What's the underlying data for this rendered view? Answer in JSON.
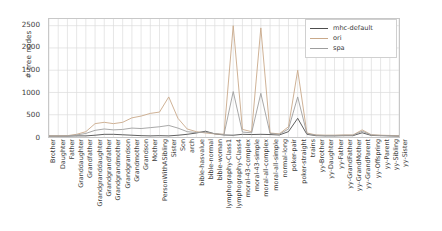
{
  "chart_data": {
    "type": "line",
    "title": "",
    "xlabel": "",
    "ylabel": "# tree nodes",
    "ylim": [
      0,
      2650
    ],
    "yticks": [
      0,
      500,
      1000,
      1500,
      2000,
      2500
    ],
    "grid": true,
    "legend_position": "upper right",
    "categories": [
      "Brother",
      "Daughter",
      "Father",
      "Granddaughter",
      "Grandfather",
      "Grandgranddaughter",
      "Grandgrandfather",
      "Grandgrandmother",
      "Grandgrandson",
      "Grandmother",
      "Grandson",
      "Mother",
      "PersonWithASibling",
      "Sister",
      "Son",
      "arch",
      "bible-hasvalue",
      "bible-normal",
      "bible-woman",
      "lymphography-Class1",
      "lymphography-Class4",
      "moral-43-complex",
      "moral-43-simple",
      "moral-all-complex",
      "moral-all-simple",
      "normal-long",
      "poker-pair",
      "poker-straight",
      "trains",
      "yy-Brother",
      "yy-Daughter",
      "yy-Father",
      "yy-GrandFather",
      "yy-GrandMother",
      "yy-GrandParent",
      "yy-Offspring",
      "yy-Parent",
      "yy-Sibling",
      "yy-Sister"
    ],
    "series": [
      {
        "name": "mhc-default",
        "color": "#4d4d4d",
        "values": [
          20,
          20,
          20,
          25,
          25,
          40,
          60,
          60,
          50,
          40,
          30,
          25,
          30,
          25,
          40,
          60,
          90,
          130,
          70,
          45,
          40,
          60,
          55,
          60,
          55,
          45,
          120,
          420,
          60,
          30,
          25,
          25,
          30,
          30,
          95,
          35,
          30,
          25,
          20
        ]
      },
      {
        "name": "ori",
        "color": "#c9a98a",
        "values": [
          25,
          25,
          30,
          60,
          120,
          300,
          330,
          300,
          330,
          430,
          470,
          530,
          560,
          900,
          420,
          180,
          120,
          90,
          70,
          60,
          2500,
          170,
          120,
          2450,
          90,
          70,
          230,
          1500,
          90,
          45,
          40,
          40,
          45,
          45,
          160,
          50,
          40,
          35,
          25
        ]
      },
      {
        "name": "spa",
        "color": "#9e9e9e",
        "values": [
          22,
          22,
          25,
          45,
          80,
          150,
          180,
          160,
          170,
          200,
          190,
          210,
          230,
          260,
          200,
          120,
          100,
          110,
          75,
          55,
          1020,
          110,
          95,
          980,
          80,
          60,
          180,
          900,
          75,
          40,
          35,
          35,
          40,
          40,
          130,
          45,
          35,
          30,
          22
        ]
      }
    ]
  },
  "legend": {
    "entries": [
      {
        "label": "mhc-default"
      },
      {
        "label": "ori"
      },
      {
        "label": "spa"
      }
    ]
  }
}
